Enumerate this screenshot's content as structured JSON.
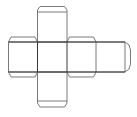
{
  "diagram": {
    "title": "",
    "faces": [
      {
        "id": "top",
        "label": ""
      },
      {
        "id": "left",
        "label": ""
      },
      {
        "id": "center",
        "label": ""
      },
      {
        "id": "right",
        "label": ""
      },
      {
        "id": "far-right",
        "label": ""
      },
      {
        "id": "bottom",
        "label": ""
      }
    ],
    "colors": {
      "outline": "#6b6b6b",
      "fold_line": "#3a3a3a",
      "background": "#ffffff"
    }
  }
}
